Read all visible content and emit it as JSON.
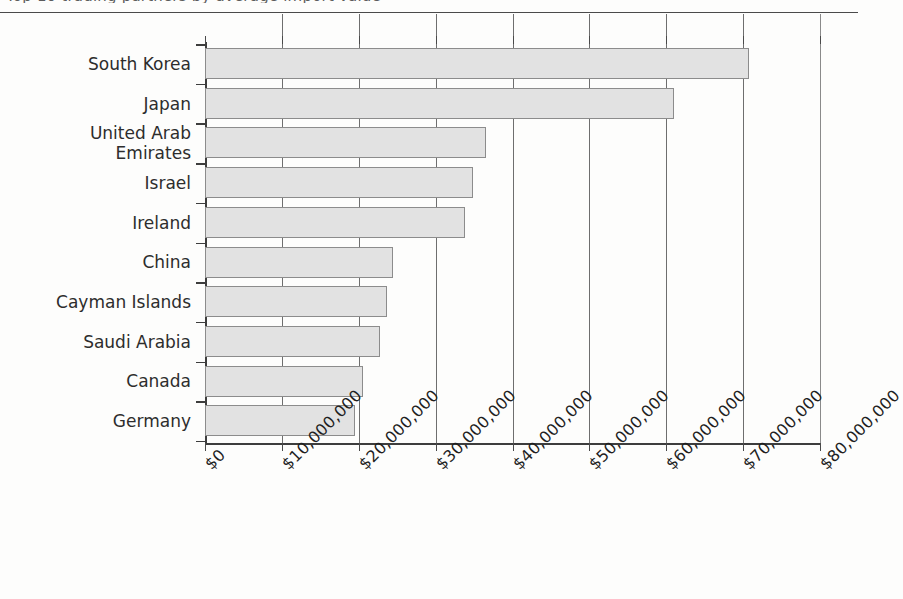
{
  "title_fragment": "Top 10 trading partners by average import value",
  "chart_data": {
    "type": "bar",
    "orientation": "horizontal",
    "title": "",
    "xlabel": "",
    "ylabel": "",
    "categories": [
      "South Korea",
      "Japan",
      "United Arab\nEmirates",
      "Israel",
      "Ireland",
      "China",
      "Cayman Islands",
      "Saudi Arabia",
      "Canada",
      "Germany"
    ],
    "values": [
      70800000,
      61000000,
      36500000,
      34800000,
      33800000,
      24500000,
      23700000,
      22800000,
      20600000,
      19500000
    ],
    "xlim": [
      0,
      80000000
    ],
    "xticks": [
      0,
      10000000,
      20000000,
      30000000,
      40000000,
      50000000,
      60000000,
      70000000,
      80000000
    ],
    "xticklabels": [
      "$0",
      "$10,000,000",
      "$20,000,000",
      "$30,000,000",
      "$40,000,000",
      "$50,000,000",
      "$60,000,000",
      "$70,000,000",
      "$80,000,000"
    ],
    "grid": true,
    "grid_axis": "x",
    "legend": false,
    "bar_fill": "#e2e2e2",
    "bar_edge": "#8c8c8c",
    "axis_color": "#3d3d3d"
  }
}
